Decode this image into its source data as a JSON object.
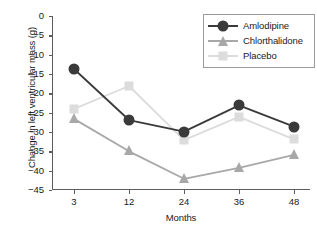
{
  "chart_data": {
    "type": "line",
    "title": "",
    "xlabel": "Months",
    "ylabel": "Change in left ventricular mass (g)",
    "categories": [
      "3",
      "12",
      "24",
      "36",
      "48"
    ],
    "x": [
      3,
      12,
      24,
      36,
      48
    ],
    "ylim": [
      -45,
      0
    ],
    "yticks": [
      "0",
      "−5",
      "−10",
      "−15",
      "−20",
      "−25",
      "−30",
      "−35",
      "−40",
      "−45"
    ],
    "ytick_values": [
      0,
      -5,
      -10,
      -15,
      -20,
      -25,
      -30,
      -35,
      -40,
      -45
    ],
    "grid": false,
    "legend_position": "top-right",
    "series": [
      {
        "name": "Amlodipine",
        "color": "#3a3a3a",
        "marker": "circle",
        "values": [
          -13.7,
          -26.9,
          -29.9,
          -23.1,
          -28.6
        ]
      },
      {
        "name": "Chlorthalidone",
        "color": "#a8a8a8",
        "marker": "triangle",
        "values": [
          -26.6,
          -35.0,
          -42.1,
          -39.3,
          -35.9
        ]
      },
      {
        "name": "Placebo",
        "color": "#dcdcdc",
        "marker": "square",
        "values": [
          -24.0,
          -18.1,
          -32.1,
          -26.1,
          -31.9
        ]
      }
    ]
  },
  "legend": {
    "entries": [
      "Amlodipine",
      "Chlorthalidone",
      "Placebo"
    ]
  },
  "axes": {
    "x_title": "Months",
    "y_title": "Change in left ventricular mass (g)"
  }
}
